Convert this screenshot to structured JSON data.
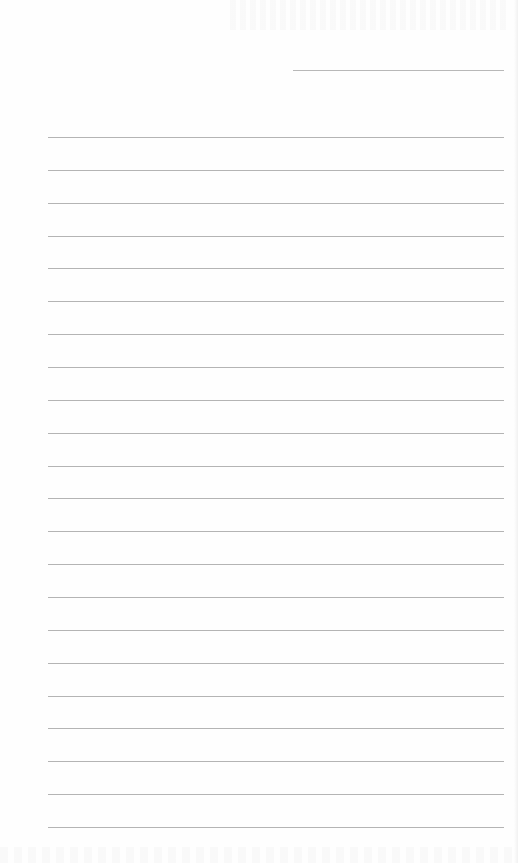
{
  "page": {
    "type": "blank ruled notebook page",
    "background_color": "#fefefe",
    "line_color": "#b4b4b4"
  },
  "header_field": {
    "label": "",
    "value": ""
  },
  "ruled_lines": {
    "count": 22,
    "first_y": 137,
    "spacing": 32.86,
    "left": 48,
    "right": 504,
    "contents": [
      "",
      "",
      "",
      "",
      "",
      "",
      "",
      "",
      "",
      "",
      "",
      "",
      "",
      "",
      "",
      "",
      "",
      "",
      "",
      "",
      "",
      ""
    ]
  }
}
